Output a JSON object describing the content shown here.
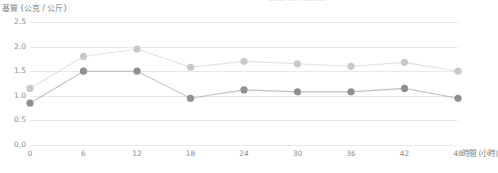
{
  "chart_data": {
    "type": "line",
    "title": "",
    "clipped_top_text": "——— —— ————",
    "xlabel": "時間 (小時)",
    "ylabel": "基質 (公克 / 公斤)",
    "x": [
      0,
      6,
      12,
      18,
      24,
      30,
      36,
      42,
      48
    ],
    "xticklabels": [
      "0",
      "6",
      "12",
      "18",
      "24",
      "30",
      "36",
      "42",
      "48"
    ],
    "yticklabels": [
      "0.0",
      "0.5",
      "1.0",
      "1.5",
      "2.0",
      "2.5"
    ],
    "yticks": [
      0.0,
      0.5,
      1.0,
      1.5,
      2.0,
      2.5
    ],
    "xlim": [
      0,
      48
    ],
    "ylim": [
      0.0,
      2.5
    ],
    "grid": true,
    "legend": "none",
    "series": [
      {
        "name": "series-light",
        "color": "#c9c9c9",
        "values": [
          1.15,
          1.8,
          1.95,
          1.58,
          1.7,
          1.65,
          1.6,
          1.68,
          1.5
        ]
      },
      {
        "name": "series-dark",
        "color": "#8f8f8f",
        "values": [
          0.85,
          1.5,
          1.5,
          0.95,
          1.12,
          1.08,
          1.08,
          1.15,
          0.95
        ]
      }
    ]
  },
  "colors": {
    "grid": "#e9e9e9",
    "axis_text": "#8c8c8c",
    "title_text": "#7d7d7d",
    "background": "#ffffff"
  }
}
